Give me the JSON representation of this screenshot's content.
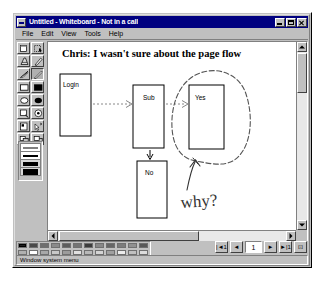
{
  "window": {
    "title": "Untitled - Whiteboard - Not in a call",
    "sysmenu_icon": "system-menu-icon",
    "minimize_label": "_",
    "maximize_label": "□",
    "close_label": "×"
  },
  "menubar": {
    "items": [
      {
        "label": "File"
      },
      {
        "label": "Edit"
      },
      {
        "label": "View"
      },
      {
        "label": "Tools"
      },
      {
        "label": "Help"
      }
    ]
  },
  "toolbar": {
    "tools": [
      {
        "name": "select-window-tool",
        "icon": "select-window-icon",
        "selected": false
      },
      {
        "name": "select-area-tool",
        "icon": "select-area-icon",
        "selected": false
      },
      {
        "name": "eraser-tool",
        "icon": "eraser-icon",
        "selected": false
      },
      {
        "name": "text-tool",
        "icon": "text-icon",
        "selected": false
      },
      {
        "name": "highlight-tool",
        "icon": "highlighter-icon",
        "selected": false
      },
      {
        "name": "pen-tool",
        "icon": "pen-icon",
        "selected": true
      },
      {
        "name": "line-tool",
        "icon": "line-icon",
        "selected": false
      },
      {
        "name": "unfilled-box-tool",
        "icon": "rectangle-outline-icon",
        "selected": false
      },
      {
        "name": "filled-box-tool",
        "icon": "rectangle-filled-icon",
        "selected": false
      },
      {
        "name": "unfilled-ellipse-tool",
        "icon": "ellipse-outline-icon",
        "selected": false
      },
      {
        "name": "filled-ellipse-tool",
        "icon": "ellipse-filled-icon",
        "selected": false
      },
      {
        "name": "zoom-tool",
        "icon": "magnifier-icon",
        "selected": false
      },
      {
        "name": "remote-pointer-tool",
        "icon": "remote-pointer-icon",
        "selected": false
      },
      {
        "name": "lock-contents-tool",
        "icon": "lock-icon",
        "selected": false
      },
      {
        "name": "sync-tool",
        "icon": "sync-pointer-icon",
        "selected": false
      },
      {
        "name": "bring-to-front-tool",
        "icon": "bring-to-front-icon",
        "selected": false
      },
      {
        "name": "send-to-back-tool",
        "icon": "send-to-back-icon",
        "selected": false
      }
    ],
    "line_widths": [
      {
        "name": "line-width-1",
        "thickness": 1,
        "selected": false
      },
      {
        "name": "line-width-2",
        "thickness": 2,
        "selected": false
      },
      {
        "name": "line-width-3",
        "thickness": 4,
        "selected": false
      },
      {
        "name": "line-width-4",
        "thickness": 6,
        "selected": true
      }
    ]
  },
  "canvas": {
    "annotation_text": "Chris: I wasn't sure about the page flow",
    "handwriting_text": "why?",
    "nodes": [
      {
        "name": "node-login",
        "label": "Login"
      },
      {
        "name": "node-sub",
        "label": "Sub"
      },
      {
        "name": "node-yes",
        "label": "Yes"
      },
      {
        "name": "node-no",
        "label": "No"
      }
    ],
    "circle_annotation": "hand-drawn-circle-around-yes",
    "arrow_annotation": "hand-drawn-arrow-to-circle"
  },
  "palette": {
    "colors_row1": [
      "#202020",
      "#4a4a4a",
      "#6e6e6e",
      "#8a8a8a",
      "#5c5c5c",
      "#747474",
      "#3c3c3c",
      "#888888",
      "#666666",
      "#7c7c7c",
      "#909090",
      "#585858"
    ],
    "colors_row2": [
      "#b0b0b0",
      "#ffffff",
      "#a8a8a8",
      "#c8c8c8",
      "#9c9c9c",
      "#e0e0e0",
      "#b8b8b8",
      "#d4d4d4",
      "#a0a0a0",
      "#ececec",
      "#c0c0c0",
      "#dcdcdc"
    ],
    "selected_index": 0
  },
  "pagenav": {
    "first_label": "|◄1",
    "prev_label": "◄",
    "page_value": "1",
    "next_label": "►",
    "last_label": "►|1",
    "new_page_label": "⊡"
  },
  "statusbar": {
    "text": "Window system menu"
  }
}
